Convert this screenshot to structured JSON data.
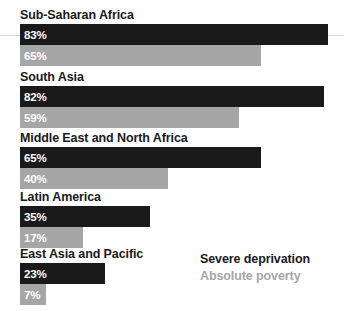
{
  "chart_data": {
    "type": "bar",
    "orientation": "horizontal",
    "title": "",
    "subtitle": "",
    "xlabel": "",
    "ylabel": "",
    "xlim": [
      0,
      100
    ],
    "grid": false,
    "value_unit": "%",
    "legend_position": "bottom-right",
    "categories": [
      "Sub-Saharan Africa",
      "South Asia",
      "Middle East and North Africa",
      "Latin America",
      "East Asia and Pacific"
    ],
    "series": [
      {
        "name": "Severe deprivation",
        "color": "#1a1a1a",
        "values": [
          83,
          82,
          65,
          35,
          23
        ],
        "labels": [
          "83%",
          "82%",
          "65%",
          "35%",
          "23%"
        ]
      },
      {
        "name": "Absolute poverty",
        "color": "#a6a6a6",
        "values": [
          65,
          59,
          40,
          17,
          7
        ],
        "labels": [
          "65%",
          "59%",
          "40%",
          "17%",
          "7%"
        ]
      }
    ]
  },
  "legend": {
    "severe_label": "Severe deprivation",
    "absolute_label": "Absolute poverty"
  },
  "colors": {
    "severe": "#1a1a1a",
    "absolute": "#a6a6a6",
    "background": "#ffffff",
    "rule": "#d4d4d4"
  }
}
